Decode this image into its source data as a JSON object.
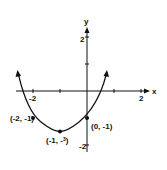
{
  "figure": {
    "type": "parabola-graph",
    "equation": "y = 1/2 x^2 + x - 1",
    "axes": {
      "x_label": "x",
      "y_label": "y",
      "x_ticks": [
        "-2",
        "2"
      ],
      "y_ticks": [
        "2",
        "-2"
      ]
    },
    "points": [
      {
        "label": "(-2, -1)",
        "x": -2,
        "y": -1
      },
      {
        "label": "(-1, -3/2)",
        "x": -1,
        "y": -1.5
      },
      {
        "label": "(0, -1)",
        "x": 0,
        "y": -1
      }
    ]
  },
  "labels": {
    "x_axis": "x",
    "y_axis": "y",
    "tick_x_neg2": "-2",
    "tick_x_pos2": "2",
    "tick_y_pos2": "2",
    "tick_y_neg2": "-2",
    "pt_left": "(-2, -1)",
    "pt_vertex": "(-1, -",
    "pt_vertex_frac": "3",
    "pt_vertex_den": "2",
    "pt_vertex_close": ")",
    "pt_right": "(0, -1)"
  }
}
